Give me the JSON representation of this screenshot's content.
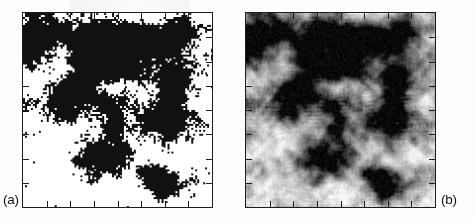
{
  "figure": {
    "type": "two-panel-image-figure",
    "background_color": "#ffffff",
    "ink_color": "#1c1c1c",
    "panels": [
      {
        "id": "a",
        "label": "(a)",
        "label_position": "outside-bottom-left",
        "rendering": "binary-thresholded",
        "description": "High-contrast black-and-white pixelated density field showing filamentary clustered structure on a white background",
        "frame": {
          "x": 22,
          "y": 12,
          "width": 191,
          "height": 196
        },
        "ticks": {
          "top": 7,
          "bottom": 7,
          "left": 7,
          "right": 7,
          "direction": "inward",
          "length_px": 6
        }
      },
      {
        "id": "b",
        "label": "(b)",
        "label_position": "outside-bottom-right",
        "rendering": "smoothed-grayscale",
        "description": "Grayscale smoothed version of the same density field, with soft blurred filaments and clumps on a white background",
        "frame": {
          "x": 245,
          "y": 12,
          "width": 191,
          "height": 196
        },
        "ticks": {
          "top": 7,
          "bottom": 7,
          "left": 7,
          "right": 7,
          "direction": "inward",
          "length_px": 6
        }
      }
    ]
  },
  "chart_data": {
    "type": "heatmap",
    "title": "",
    "xlabel": "",
    "ylabel": "",
    "grid": false,
    "legend": "none",
    "panel_count": 2,
    "panels": [
      {
        "name": "(a)",
        "colormap": "binary black/white",
        "value_range": [
          0,
          1
        ],
        "note": "thresholded density field"
      },
      {
        "name": "(b)",
        "colormap": "grayscale",
        "value_range": [
          0,
          1
        ],
        "note": "smoothed density field"
      }
    ],
    "clumps": [
      {
        "panel": "a",
        "x": 0.16,
        "y": 0.1,
        "w": 0.1,
        "h": 0.06,
        "v": 1.0
      },
      {
        "panel": "a",
        "x": 0.43,
        "y": 0.09,
        "w": 0.07,
        "h": 0.05,
        "v": 1.0
      },
      {
        "panel": "a",
        "x": 0.62,
        "y": 0.14,
        "w": 0.16,
        "h": 0.09,
        "v": 1.0
      },
      {
        "panel": "a",
        "x": 0.84,
        "y": 0.08,
        "w": 0.09,
        "h": 0.07,
        "v": 1.0
      },
      {
        "panel": "a",
        "x": 0.28,
        "y": 0.33,
        "w": 0.09,
        "h": 0.06,
        "v": 1.0
      },
      {
        "panel": "a",
        "x": 0.55,
        "y": 0.31,
        "w": 0.12,
        "h": 0.05,
        "v": 1.0
      },
      {
        "panel": "a",
        "x": 0.79,
        "y": 0.36,
        "w": 0.08,
        "h": 0.16,
        "v": 1.0
      },
      {
        "panel": "a",
        "x": 0.2,
        "y": 0.52,
        "w": 0.07,
        "h": 0.05,
        "v": 1.0
      },
      {
        "panel": "a",
        "x": 0.48,
        "y": 0.58,
        "w": 0.08,
        "h": 0.06,
        "v": 1.0
      },
      {
        "panel": "a",
        "x": 0.36,
        "y": 0.76,
        "w": 0.12,
        "h": 0.08,
        "v": 1.0
      },
      {
        "panel": "a",
        "x": 0.68,
        "y": 0.82,
        "w": 0.1,
        "h": 0.05,
        "v": 1.0
      },
      {
        "panel": "b",
        "x": 0.1,
        "y": 0.1,
        "w": 0.16,
        "h": 0.13,
        "v": 0.95
      },
      {
        "panel": "b",
        "x": 0.38,
        "y": 0.12,
        "w": 0.15,
        "h": 0.16,
        "v": 0.95
      },
      {
        "panel": "b",
        "x": 0.7,
        "y": 0.14,
        "w": 0.18,
        "h": 0.14,
        "v": 0.95
      },
      {
        "panel": "b",
        "x": 0.5,
        "y": 0.26,
        "w": 0.12,
        "h": 0.1,
        "v": 0.95
      },
      {
        "panel": "b",
        "x": 0.24,
        "y": 0.44,
        "w": 0.14,
        "h": 0.12,
        "v": 0.95
      },
      {
        "panel": "b",
        "x": 0.46,
        "y": 0.46,
        "w": 0.13,
        "h": 0.1,
        "v": 0.9
      },
      {
        "panel": "b",
        "x": 0.72,
        "y": 0.54,
        "w": 0.12,
        "h": 0.16,
        "v": 0.9
      },
      {
        "panel": "b",
        "x": 0.46,
        "y": 0.74,
        "w": 0.12,
        "h": 0.14,
        "v": 0.9
      },
      {
        "panel": "b",
        "x": 0.72,
        "y": 0.88,
        "w": 0.14,
        "h": 0.1,
        "v": 0.9
      }
    ]
  }
}
